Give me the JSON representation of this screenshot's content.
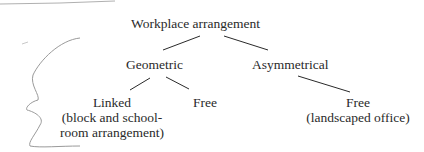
{
  "diagram": {
    "root": {
      "label": "Workplace arrangement"
    },
    "nodes": [
      {
        "id": "geometric",
        "label": "Geometric"
      },
      {
        "id": "asymmetrical",
        "label": "Asymmetrical"
      },
      {
        "id": "linked",
        "label": "Linked",
        "note_lines": [
          "(block and school-",
          "room arrangement)"
        ]
      },
      {
        "id": "free-geometric",
        "label": "Free"
      },
      {
        "id": "free-asymmetrical",
        "label": "Free",
        "note_lines": [
          "(landscaped office)"
        ]
      }
    ],
    "edges": [
      [
        "root",
        "geometric"
      ],
      [
        "root",
        "asymmetrical"
      ],
      [
        "geometric",
        "linked"
      ],
      [
        "geometric",
        "free-geometric"
      ],
      [
        "asymmetrical",
        "free-asymmetrical"
      ]
    ],
    "annotations": [
      "hand-drawn-bracket",
      "pencil-stroke-top"
    ]
  },
  "colors": {
    "ink": "#2a2a2a",
    "pencil": "#9a9a9a",
    "background": "#ffffff"
  }
}
